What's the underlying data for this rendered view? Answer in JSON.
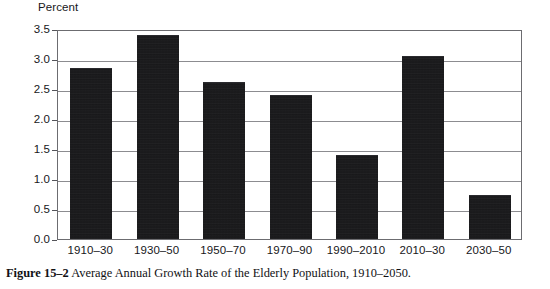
{
  "figure": {
    "caption_label": "Figure 15–2",
    "caption_text": "Average Annual Growth Rate of the Elderly Population, 1910–2050."
  },
  "chart_data": {
    "type": "bar",
    "title": "",
    "xlabel": "",
    "ylabel": "Percent",
    "categories": [
      "1910–30",
      "1930–50",
      "1950–70",
      "1970–90",
      "1990–2010",
      "2010–30",
      "2030–50"
    ],
    "values": [
      2.85,
      3.4,
      2.62,
      2.4,
      1.4,
      3.05,
      0.73
    ],
    "ylim": [
      0.0,
      3.5
    ],
    "ytick_step": 0.5,
    "ytick_labels": [
      "0.0",
      "0.5",
      "1.0",
      "1.5",
      "2.0",
      "2.5",
      "3.0",
      "3.5"
    ],
    "grid": true,
    "legend": "none",
    "bar_color": "#121214",
    "gridline_color": "#8c8c90",
    "frame_color": "#6c6c70"
  }
}
